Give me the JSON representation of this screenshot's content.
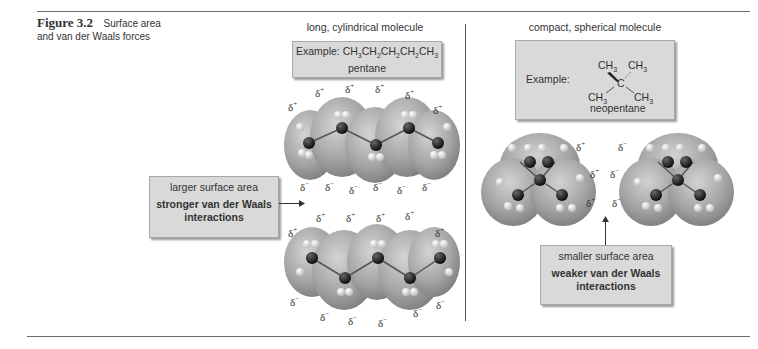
{
  "caption": {
    "figure_label": "Figure 3.2",
    "text_line1": "Surface area",
    "text_line2": "and van der Waals forces"
  },
  "left_panel": {
    "heading": "long, cylindrical molecule",
    "example_prefix": "Example:",
    "formula_parts": [
      "CH",
      "3",
      "CH",
      "2",
      "CH",
      "2",
      "CH",
      "2",
      "CH",
      "3"
    ],
    "name": "pentane",
    "annotation": {
      "line1": "larger surface area",
      "line2": "stronger van der Waals",
      "line3": "interactions"
    },
    "top_molecule_charges": {
      "plus": "δ+",
      "minus": "δ−"
    },
    "bottom_molecule_charges": {
      "plus": "δ+",
      "minus": "δ−"
    }
  },
  "right_panel": {
    "heading": "compact, spherical molecule",
    "example_prefix": "Example:",
    "structure_labels": {
      "top_left": "CH3",
      "top_right": "CH3",
      "center": "C",
      "bottom_left": "CH3",
      "bottom_right": "CH3"
    },
    "name": "neopentane",
    "annotation": {
      "line1": "smaller surface area",
      "line2": "weaker van der Waals",
      "line3": "interactions"
    }
  },
  "symbols": {
    "delta": "δ",
    "plus": "+",
    "minus": "−",
    "ch": "CH",
    "three": "3"
  },
  "colors": {
    "box_fill": "#d9d9d9",
    "surface": "#a9a9a9",
    "carbon": "#1a1a1a",
    "hydrogen": "#e8e8e8"
  }
}
